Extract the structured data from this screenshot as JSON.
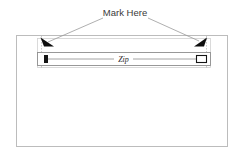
{
  "diagram": {
    "type": "technical-illustration",
    "background_color": "#ffffff",
    "annotation": {
      "label": "Mark Here",
      "text_color": "#3a3a3a",
      "leader_line_color": "#9a9a9a"
    },
    "outer_panel": {
      "name": "garment-panel",
      "stroke_color": "#b9b9b9",
      "fill_color": "#ffffff",
      "x": 16,
      "y": 35,
      "width": 212,
      "height": 112
    },
    "zipper_region": {
      "name": "zipper-region-box",
      "stroke_color": "#cdcdcd",
      "x": 37,
      "y": 38,
      "width": 174,
      "height": 30
    },
    "zipper_tape": {
      "name": "zipper-tape",
      "stroke_color": "#8e8e8e",
      "fill_color": "#ffffff",
      "x": 37,
      "y": 52,
      "width": 174,
      "height": 14,
      "center_line_color": "#8e8e8e",
      "label": "Zip"
    },
    "zipper_stop": {
      "name": "zipper-bottom-stop",
      "fill_color": "#1a1a1a",
      "x": 44,
      "y": 55,
      "width": 4,
      "height": 8
    },
    "zipper_slider": {
      "name": "zipper-slider-pull",
      "stroke_color": "#1a1a1a",
      "fill_color": "#ffffff",
      "x": 197,
      "y": 55,
      "width": 10,
      "height": 7
    },
    "markers": [
      {
        "name": "left-mark-arrow",
        "color": "#0d0d0d",
        "guide_color": "#b0b0b0",
        "x": 44,
        "y": 40
      },
      {
        "name": "right-mark-arrow",
        "color": "#0d0d0d",
        "guide_color": "#b0b0b0",
        "x": 201,
        "y": 40
      }
    ]
  }
}
